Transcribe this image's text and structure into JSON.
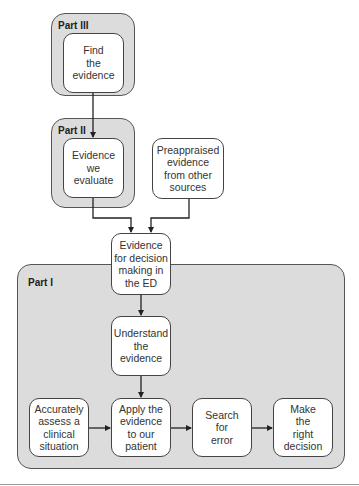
{
  "parts": {
    "part3": {
      "label": "Part III"
    },
    "part2": {
      "label": "Part II"
    },
    "part1": {
      "label": "Part I"
    }
  },
  "nodes": {
    "find_evidence": "Find\nthe\nevidence",
    "evidence_we_evaluate": "Evidence\nwe\nevaluate",
    "preappraised": "Preappraised\nevidence\nfrom other\nsources",
    "evidence_decision": "Evidence\nfor decision\nmaking in\nthe ED",
    "understand": "Understand\nthe\nevidence",
    "assess": "Accurately\nassess a\nclinical\nsituation",
    "apply": "Apply the\nevidence\nto our\npatient",
    "search_error": "Search\nfor\nerror",
    "decision": "Make\nthe\nright\ndecision"
  },
  "colors": {
    "container_fill": "#dcdcdc",
    "box_fill": "#ffffff",
    "stroke": "#444444"
  }
}
